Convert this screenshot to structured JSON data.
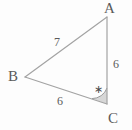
{
  "figure": {
    "type": "triangle-diagram",
    "background_color": "#fdfdfd",
    "stroke_color": "#a3a3a3",
    "label_color": "#5a5a5a",
    "angle_fill_color": "#c9c9c9"
  },
  "vertices": [
    {
      "name": "A",
      "label": "A",
      "x": 107,
      "y": 17
    },
    {
      "name": "B",
      "label": "B",
      "x": 25,
      "y": 77
    },
    {
      "name": "C",
      "label": "C",
      "x": 107,
      "y": 104
    }
  ],
  "sides": [
    {
      "name": "AB",
      "label": "7",
      "from": "A",
      "to": "B"
    },
    {
      "name": "BC",
      "label": "6",
      "from": "B",
      "to": "C"
    },
    {
      "name": "CA",
      "label": "6",
      "from": "C",
      "to": "A"
    }
  ],
  "angle_marks": [
    {
      "name": "angle-C",
      "at": "C",
      "symbol": "∗",
      "shaded": true
    }
  ]
}
